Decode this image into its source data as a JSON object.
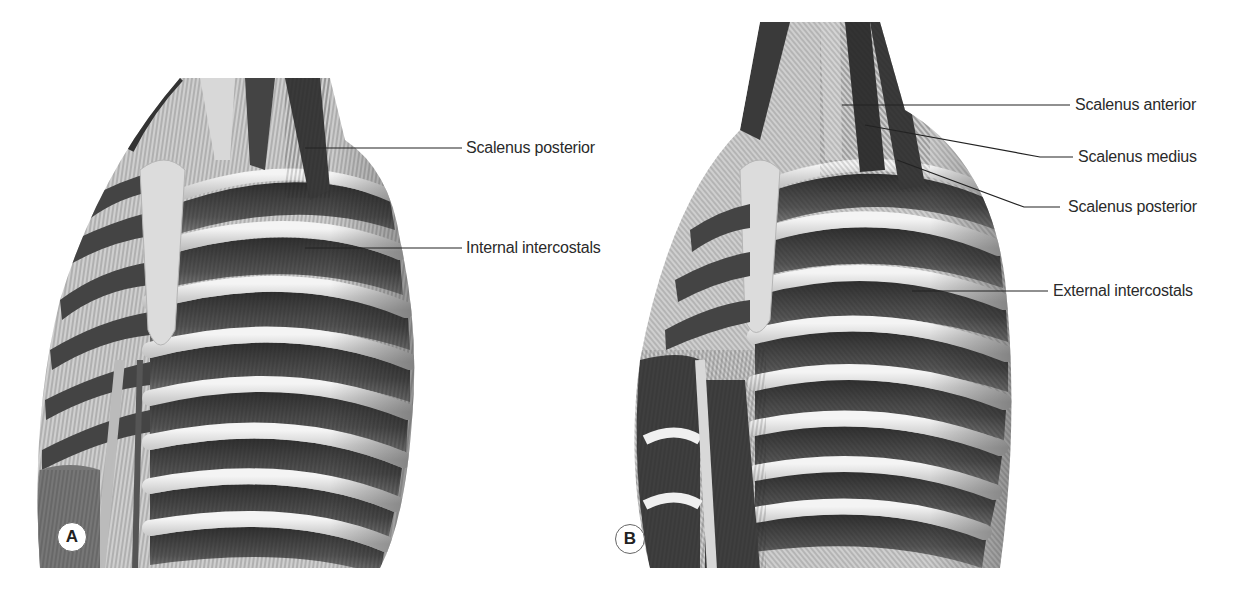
{
  "figure": {
    "panels": [
      {
        "id": "A",
        "badge": "A",
        "labels": [
          {
            "text": "Scalenus posterior"
          },
          {
            "text": "Internal intercostals"
          }
        ]
      },
      {
        "id": "B",
        "badge": "B",
        "labels": [
          {
            "text": "Scalenus anterior"
          },
          {
            "text": "Scalenus medius"
          },
          {
            "text": "Scalenus posterior"
          },
          {
            "text": "External intercostals"
          }
        ]
      }
    ],
    "colors": {
      "background": "#ffffff",
      "muscle_dark": "#3a3a3a",
      "muscle_mid": "#6b6b6b",
      "bone": "#d6d6d6",
      "bone_highlight": "#f2f2f2",
      "leader_line": "#222222",
      "label_text": "#2a2a2a"
    }
  }
}
